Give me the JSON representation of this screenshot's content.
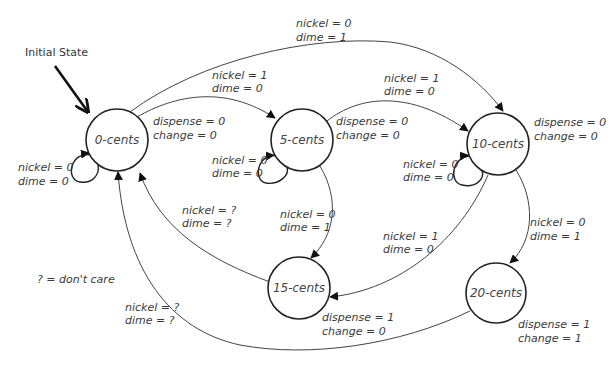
{
  "diagram": {
    "type": "finite-state-machine",
    "initial_label": "Initial State",
    "legend": "? = don't care",
    "states": [
      {
        "id": "s0",
        "label": "0-cents",
        "output": [
          "dispense = 0",
          "change = 0"
        ],
        "self_loop": [
          "nickel = 0",
          "dime = 0"
        ]
      },
      {
        "id": "s5",
        "label": "5-cents",
        "output": [
          "dispense = 0",
          "change = 0"
        ],
        "self_loop": [
          "nickel = 0",
          "dime = 0"
        ]
      },
      {
        "id": "s10",
        "label": "10-cents",
        "output": [
          "dispense = 0",
          "change = 0"
        ],
        "self_loop": [
          "nickel = 0",
          "dime = 0"
        ]
      },
      {
        "id": "s15",
        "label": "15-cents",
        "output": [
          "dispense = 1",
          "change = 0"
        ]
      },
      {
        "id": "s20",
        "label": "20-cents",
        "output": [
          "dispense = 1",
          "change = 1"
        ]
      }
    ],
    "transitions": [
      {
        "from": "0-cents",
        "to": "5-cents",
        "label": [
          "nickel = 1",
          "dime = 0"
        ]
      },
      {
        "from": "0-cents",
        "to": "10-cents",
        "label": [
          "nickel = 0",
          "dime = 1"
        ]
      },
      {
        "from": "5-cents",
        "to": "10-cents",
        "label": [
          "nickel = 1",
          "dime = 0"
        ]
      },
      {
        "from": "5-cents",
        "to": "15-cents",
        "label": [
          "nickel = 0",
          "dime = 1"
        ]
      },
      {
        "from": "10-cents",
        "to": "15-cents",
        "label": [
          "nickel = 1",
          "dime = 0"
        ]
      },
      {
        "from": "10-cents",
        "to": "20-cents",
        "label": [
          "nickel = 0",
          "dime = 1"
        ]
      },
      {
        "from": "15-cents",
        "to": "0-cents",
        "label": [
          "nickel = ?",
          "dime = ?"
        ]
      },
      {
        "from": "20-cents",
        "to": "0-cents",
        "label": [
          "nickel = ?",
          "dime = ?"
        ]
      }
    ]
  }
}
